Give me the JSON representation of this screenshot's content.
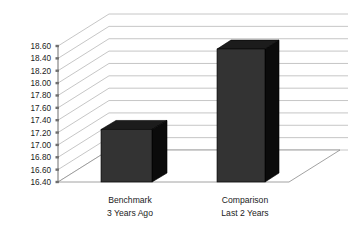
{
  "chart_data": {
    "type": "bar",
    "title": "",
    "subtitle": "",
    "xlabel": "",
    "ylabel": "",
    "categories": [
      "Benchmark 3 Years Ago",
      "Comparison Last 2 Years"
    ],
    "category_lines": [
      [
        "Benchmark",
        "3 Years Ago"
      ],
      [
        "Comparison",
        "Last 2 Years"
      ]
    ],
    "values": [
      17.25,
      18.55
    ],
    "ylim": [
      16.4,
      18.6
    ],
    "ytick_step": 0.2,
    "ytick_labels": [
      "18.60",
      "18.40",
      "18.20",
      "18.00",
      "17.80",
      "17.60",
      "17.40",
      "17.20",
      "17.00",
      "16.80",
      "16.60",
      "16.40"
    ],
    "ytick_values": [
      18.6,
      18.4,
      18.2,
      18.0,
      17.8,
      17.6,
      17.4,
      17.2,
      17.0,
      16.8,
      16.6,
      16.4
    ],
    "grid": true,
    "legend": false,
    "legend_position": "none",
    "three_d": true,
    "annotations": []
  },
  "style": {
    "background": "#ffffff",
    "bar_front_color": "#333333",
    "bar_side_color": "#0b0b0b",
    "bar_top_color": "#1c1c1c",
    "gridline_color": "#b8b8b8",
    "axis_color": "#6e6e6e",
    "text_color": "#1b1b1b"
  }
}
